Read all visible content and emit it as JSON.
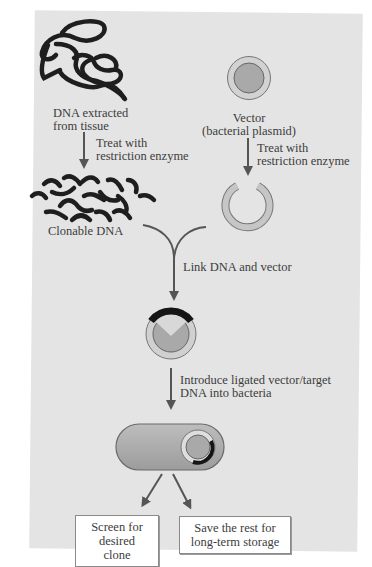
{
  "diagram": {
    "colors": {
      "background": "#e4e4e4",
      "dna_strand": "#1e1e1e",
      "plasmid_fill": "#a8a8a8",
      "plasmid_ring": "#c8c8c8",
      "arrow": "#555555",
      "box_bg": "#ffffff"
    },
    "nodes": {
      "dna_source": {
        "icon": "tangled-dna-icon",
        "label_line1": "DNA extracted",
        "label_line2": "from tissue"
      },
      "vector": {
        "icon": "plasmid-icon",
        "label_line1": "Vector",
        "label_line2": "(bacterial plasmid)"
      },
      "clonable_dna": {
        "icon": "dna-fragments-icon",
        "label": "Clonable DNA"
      },
      "cut_vector": {
        "icon": "opened-plasmid-icon"
      },
      "recombinant": {
        "icon": "recombinant-plasmid-icon"
      },
      "bacterium": {
        "icon": "bacterium-with-plasmid-icon"
      }
    },
    "steps": {
      "dna_treat_line1": "Treat with",
      "dna_treat_line2": "restriction enzyme",
      "vector_treat_line1": "Treat with",
      "vector_treat_line2": "restriction enzyme",
      "link": "Link DNA and vector",
      "introduce_line1": "Introduce ligated vector/target",
      "introduce_line2": "DNA into bacteria"
    },
    "outcomes": [
      {
        "line1": "Screen for",
        "line2": "desired clone"
      },
      {
        "line1": "Save the rest for",
        "line2": "long-term storage"
      }
    ]
  }
}
